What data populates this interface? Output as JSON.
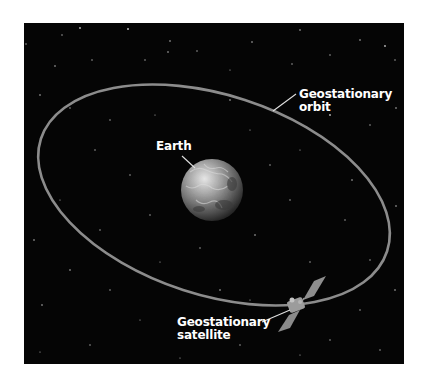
{
  "diagram": {
    "background_color": "#050505",
    "orbit_color": "#8c8c8c",
    "label_color": "#ffffff",
    "labels": {
      "orbit": {
        "line1": "Geostationary",
        "line2": "orbit"
      },
      "earth": {
        "text": "Earth"
      },
      "satellite": {
        "line1": "Geostationary",
        "line2": "satellite"
      }
    },
    "icons": {
      "earth": "earth-globe",
      "satellite": "satellite",
      "stars": "starfield"
    }
  }
}
